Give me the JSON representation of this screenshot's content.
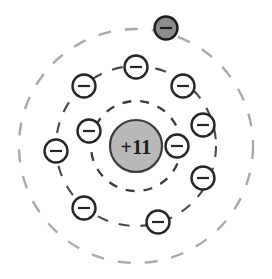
{
  "diagram": {
    "kind": "bohr-atomic-model",
    "background_color": "#ffffff",
    "canvas": {
      "width": 272,
      "height": 279
    },
    "center": {
      "x": 136,
      "y": 146
    }
  },
  "nucleus": {
    "label": "+11",
    "charge_number": 11,
    "radius": 26,
    "fill_color": "#b9b9b9",
    "stroke_color": "#3c3c3c",
    "text_color": "#1a1a1a",
    "cx": 136,
    "cy": 146
  },
  "shells": [
    {
      "name": "K-shell",
      "index": 1,
      "radius": 45,
      "electron_count": 2,
      "stroke_color": "#3a3a3a",
      "stroke_width": 2.3,
      "dash": "9 9"
    },
    {
      "name": "L-shell",
      "index": 2,
      "radius": 80,
      "electron_count": 8,
      "stroke_color": "#4a4a4a",
      "stroke_width": 2.1,
      "dash": "11 11"
    },
    {
      "name": "M-shell",
      "index": 3,
      "radius": 117,
      "electron_count": 1,
      "stroke_color": "#a9a9a9",
      "stroke_width": 2.4,
      "dash": "13 14"
    }
  ],
  "electrons": [
    {
      "id": "e1",
      "shell": "K-shell",
      "sign": "minus",
      "cx": 89,
      "cy": 131,
      "r": 11.5,
      "fill_color": "#ffffff",
      "stroke_color": "#262626"
    },
    {
      "id": "e2",
      "shell": "K-shell",
      "sign": "minus",
      "cx": 177,
      "cy": 146,
      "r": 11.5,
      "fill_color": "#ffffff",
      "stroke_color": "#262626"
    },
    {
      "id": "e3",
      "shell": "L-shell",
      "sign": "minus",
      "cx": 136,
      "cy": 67,
      "r": 11.5,
      "fill_color": "#ffffff",
      "stroke_color": "#262626"
    },
    {
      "id": "e4",
      "shell": "L-shell",
      "sign": "minus",
      "cx": 84,
      "cy": 86,
      "r": 11.5,
      "fill_color": "#ffffff",
      "stroke_color": "#262626"
    },
    {
      "id": "e5",
      "shell": "L-shell",
      "sign": "minus",
      "cx": 183,
      "cy": 86,
      "r": 11.5,
      "fill_color": "#ffffff",
      "stroke_color": "#262626"
    },
    {
      "id": "e6",
      "shell": "L-shell",
      "sign": "minus",
      "cx": 56,
      "cy": 151,
      "r": 11.5,
      "fill_color": "#ffffff",
      "stroke_color": "#262626"
    },
    {
      "id": "e7",
      "shell": "L-shell",
      "sign": "minus",
      "cx": 203,
      "cy": 125,
      "r": 11.5,
      "fill_color": "#ffffff",
      "stroke_color": "#262626"
    },
    {
      "id": "e8",
      "shell": "L-shell",
      "sign": "minus",
      "cx": 203,
      "cy": 178,
      "r": 11.5,
      "fill_color": "#ffffff",
      "stroke_color": "#262626"
    },
    {
      "id": "e9",
      "shell": "L-shell",
      "sign": "minus",
      "cx": 84,
      "cy": 208,
      "r": 11.5,
      "fill_color": "#ffffff",
      "stroke_color": "#262626"
    },
    {
      "id": "e10",
      "shell": "L-shell",
      "sign": "minus",
      "cx": 158,
      "cy": 222,
      "r": 11.5,
      "fill_color": "#ffffff",
      "stroke_color": "#262626"
    },
    {
      "id": "e11",
      "shell": "M-shell",
      "sign": "minus",
      "cx": 166,
      "cy": 28,
      "r": 11.5,
      "fill_color": "#8c8c8c",
      "stroke_color": "#1c1c1c"
    }
  ]
}
